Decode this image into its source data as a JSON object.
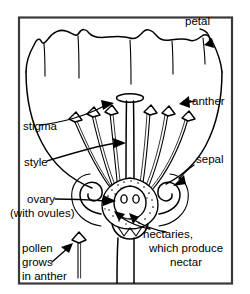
{
  "diagram": {
    "style": "black and white line drawing",
    "background_color": "#ffffff",
    "line_color": "#000000",
    "frame_color": "#3a3a3a"
  },
  "labels": {
    "petal": "petal",
    "anther": "anther",
    "stigma": "stigma",
    "style": "style",
    "sepal": "sepal",
    "ovary_line1": "ovary",
    "ovary_line2": "(with ovules)",
    "pollen_line1": "pollen",
    "pollen_line2": "grows",
    "pollen_line3": "in anther",
    "nectaries_line1": "nectaries,",
    "nectaries_line2": "which produce",
    "nectaries_line3": "nectar"
  },
  "parts": {
    "petal_count": 5,
    "stamen_count": 6,
    "stamens_left": 3,
    "stamens_right": 3,
    "ovule_count": 2,
    "sepal_count": 2,
    "nectary_arrow_count": 2,
    "stigma_count": 1,
    "style_count": 1,
    "pollen_icon_label": "stamen-icon"
  }
}
